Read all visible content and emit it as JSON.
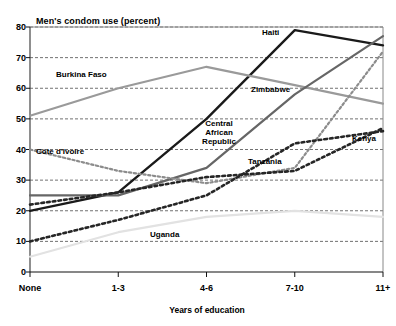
{
  "chart_data": {
    "type": "line",
    "title": "Men's condom use (percent)",
    "xlabel": "Years of education",
    "ylabel": "",
    "categories": [
      "None",
      "1-3",
      "4-6",
      "7-10",
      "11+"
    ],
    "yticks": [
      0,
      10,
      20,
      30,
      40,
      50,
      60,
      70,
      80
    ],
    "ylim": [
      0,
      80
    ],
    "grid": true,
    "legend_position": "inline-labels",
    "series": [
      {
        "name": "Haiti",
        "values": [
          20,
          26,
          50,
          79,
          74
        ],
        "style": "solid",
        "color": "#1a1a1a",
        "width": 2.4
      },
      {
        "name": "Burkina Faso",
        "values": [
          51,
          60,
          67,
          61,
          55
        ],
        "style": "solid",
        "color": "#9a9a9a",
        "width": 2.2
      },
      {
        "name": "Zimbabwe",
        "values": [
          25,
          25,
          34,
          58,
          77
        ],
        "style": "solid",
        "color": "#666666",
        "width": 2.2
      },
      {
        "name": "Central African Republic",
        "values": [
          40,
          33,
          29,
          34,
          72
        ],
        "style": "dotted",
        "color": "#8c8c8c",
        "width": 2.2
      },
      {
        "name": "Tanzania",
        "values": [
          22,
          26,
          31,
          33,
          47
        ],
        "style": "dotted",
        "color": "#262626",
        "width": 2.6
      },
      {
        "name": "Kenya",
        "values": [
          10,
          17,
          25,
          42,
          46
        ],
        "style": "dotted",
        "color": "#262626",
        "width": 2.6
      },
      {
        "name": "Uganda",
        "values": [
          5,
          13,
          18,
          20,
          18
        ],
        "style": "solid",
        "color": "#e2e2e2",
        "width": 2.2
      }
    ],
    "annotations": [
      {
        "text": "Haiti",
        "x": 262,
        "y": 28
      },
      {
        "text": "Burkina Faso",
        "x": 56,
        "y": 70
      },
      {
        "text": "Zimbabwe",
        "x": 251,
        "y": 85
      },
      {
        "text": "Central African Republic",
        "x": 197,
        "y": 119
      },
      {
        "text": "Côte d'Ivoire",
        "x": 36,
        "y": 147
      },
      {
        "text": "Tanzania",
        "x": 248,
        "y": 157
      },
      {
        "text": "Kenya",
        "x": 352,
        "y": 134
      },
      {
        "text": "Uganda",
        "x": 150,
        "y": 230
      }
    ]
  }
}
